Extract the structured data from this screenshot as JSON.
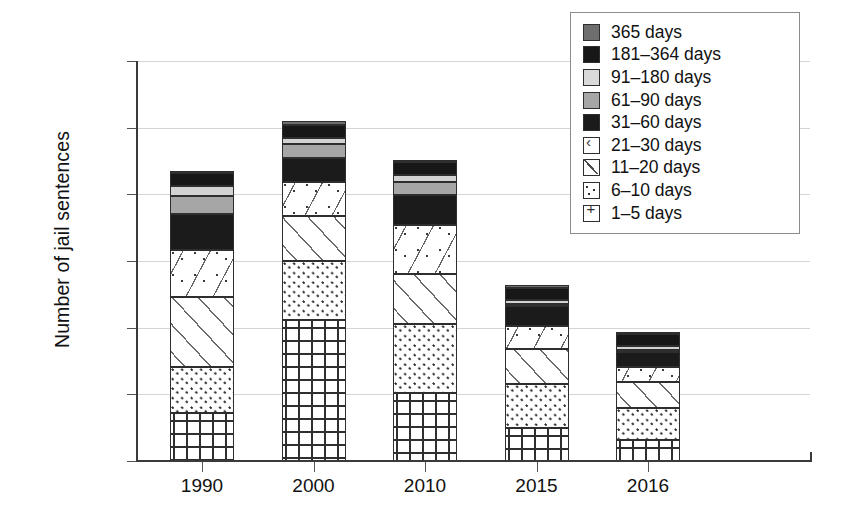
{
  "chart_data": {
    "type": "bar",
    "subtype": "stacked-bar",
    "title": "",
    "xlabel": "",
    "ylabel": "Number of jail sentences",
    "categories": [
      "1990",
      "2000",
      "2010",
      "2015",
      "2016"
    ],
    "ylim": [
      0,
      30000
    ],
    "ytick_labels": [
      "0",
      "5,000",
      "10,000",
      "15,000",
      "20,000",
      "25,000",
      "30,000"
    ],
    "ytick_values": [
      0,
      5000,
      10000,
      15000,
      20000,
      25000,
      30000
    ],
    "grid": true,
    "legend_position": "top-right",
    "series": [
      {
        "name": "1–5 days",
        "fill": "cross-hatch-plus",
        "color": "#ffffff",
        "values": [
          3600,
          10600,
          5100,
          2450,
          1600
        ]
      },
      {
        "name": "6–10 days",
        "fill": "fine-dots",
        "color": "#ffffff",
        "values": [
          3450,
          4400,
          5200,
          3350,
          2400
        ]
      },
      {
        "name": "11–20 days",
        "fill": "diagonal-hatch",
        "color": "#ffffff",
        "values": [
          5250,
          3400,
          3700,
          2600,
          1900
        ]
      },
      {
        "name": "21–30 days",
        "fill": "sparse-chevrons",
        "color": "#ffffff",
        "values": [
          3500,
          2500,
          3700,
          1750,
          1150
        ]
      },
      {
        "name": "31–60 days",
        "fill": "solid",
        "color": "#1b1b1b",
        "values": [
          2700,
          1850,
          2250,
          1450,
          1150
        ]
      },
      {
        "name": "61–90 days",
        "fill": "solid",
        "color": "#a6a6a6",
        "values": [
          1400,
          1050,
          1000,
          150,
          150
        ]
      },
      {
        "name": "91–180 days",
        "fill": "solid",
        "color": "#d2d2d2",
        "values": [
          700,
          400,
          500,
          300,
          250
        ]
      },
      {
        "name": "181–364 days",
        "fill": "solid",
        "color": "#171717",
        "values": [
          1000,
          1000,
          950,
          950,
          900
        ]
      },
      {
        "name": "365 days",
        "fill": "solid",
        "color": "#6e6e6e",
        "values": [
          100,
          300,
          100,
          200,
          150
        ]
      }
    ],
    "totals": [
      21700,
      25500,
      22500,
      13150,
      9650
    ]
  },
  "axis": {
    "ylabel": "Number of jail sentences",
    "yticks": [
      "30,000",
      "25,000",
      "20,000",
      "15,000",
      "10,000",
      "5,000",
      "0"
    ],
    "xticks": [
      "1990",
      "2000",
      "2010",
      "2015",
      "2016"
    ]
  },
  "legend": {
    "items": [
      {
        "label": "365 days",
        "swatch": "s365"
      },
      {
        "label": "181–364 days",
        "swatch": "s181"
      },
      {
        "label": "91–180 days",
        "swatch": "s91"
      },
      {
        "label": "61–90 days",
        "swatch": "s61"
      },
      {
        "label": "31–60 days",
        "swatch": "s31"
      },
      {
        "label": "21–30 days",
        "swatch": "s21"
      },
      {
        "label": "11–20 days",
        "swatch": "s11"
      },
      {
        "label": "6–10 days",
        "swatch": "s6"
      },
      {
        "label": "1–5 days",
        "swatch": "s1"
      }
    ]
  }
}
